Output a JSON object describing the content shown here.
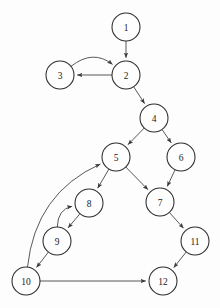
{
  "graph": {
    "title": "Directed Graph",
    "node_radius": 14,
    "node_fill": "#fefefe",
    "node_stroke": "#2b2b2b",
    "edge_stroke": "#3a3a3a",
    "background": "#fdfdfd",
    "nodes": [
      {
        "id": "1",
        "label": "1",
        "x": 126,
        "y": 27
      },
      {
        "id": "2",
        "label": "2",
        "x": 126,
        "y": 75
      },
      {
        "id": "3",
        "label": "3",
        "x": 60,
        "y": 75
      },
      {
        "id": "4",
        "label": "4",
        "x": 154,
        "y": 118
      },
      {
        "id": "5",
        "label": "5",
        "x": 116,
        "y": 157
      },
      {
        "id": "6",
        "label": "6",
        "x": 181,
        "y": 157
      },
      {
        "id": "7",
        "label": "7",
        "x": 160,
        "y": 202
      },
      {
        "id": "8",
        "label": "8",
        "x": 89,
        "y": 203
      },
      {
        "id": "9",
        "label": "9",
        "x": 57,
        "y": 241
      },
      {
        "id": "10",
        "label": "10",
        "x": 26,
        "y": 281
      },
      {
        "id": "11",
        "label": "11",
        "x": 195,
        "y": 241
      },
      {
        "id": "12",
        "label": "12",
        "x": 163,
        "y": 281
      }
    ],
    "edges": [
      {
        "from": "1",
        "to": "2",
        "shape": "straight",
        "curve": 0
      },
      {
        "from": "2",
        "to": "3",
        "shape": "straight",
        "curve": 0
      },
      {
        "from": "3",
        "to": "2",
        "shape": "curved",
        "curve": -26
      },
      {
        "from": "2",
        "to": "4",
        "shape": "straight",
        "curve": 0
      },
      {
        "from": "4",
        "to": "5",
        "shape": "straight",
        "curve": 0
      },
      {
        "from": "4",
        "to": "6",
        "shape": "straight",
        "curve": 0
      },
      {
        "from": "5",
        "to": "7",
        "shape": "straight",
        "curve": 0
      },
      {
        "from": "6",
        "to": "7",
        "shape": "straight",
        "curve": 0
      },
      {
        "from": "5",
        "to": "8",
        "shape": "straight",
        "curve": 0
      },
      {
        "from": "8",
        "to": "9",
        "shape": "straight",
        "curve": 0
      },
      {
        "from": "9",
        "to": "8",
        "shape": "curved",
        "curve": -20
      },
      {
        "from": "9",
        "to": "10",
        "shape": "straight",
        "curve": 0
      },
      {
        "from": "10",
        "to": "5",
        "shape": "curved",
        "curve": -44
      },
      {
        "from": "7",
        "to": "11",
        "shape": "straight",
        "curve": 0
      },
      {
        "from": "11",
        "to": "12",
        "shape": "straight",
        "curve": 0
      },
      {
        "from": "10",
        "to": "12",
        "shape": "straight",
        "curve": 0
      }
    ]
  }
}
